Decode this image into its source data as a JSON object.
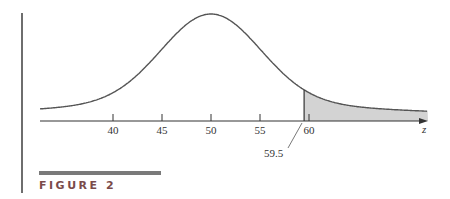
{
  "figure": {
    "label": "FIGURE 2"
  },
  "chart_data": {
    "type": "area",
    "title": "",
    "xlabel": "z",
    "ylabel": "",
    "x_ticks": [
      40,
      45,
      50,
      55,
      60
    ],
    "x_tick_labels": [
      "40",
      "45",
      "50",
      "55",
      "60"
    ],
    "annotation": {
      "label": "59.5",
      "x": 59.5
    },
    "distribution": {
      "mean": 50,
      "sd": 5
    },
    "shaded_region": {
      "from": 59.5,
      "to": "inf",
      "color": "#d3d3d3"
    },
    "grid": false
  },
  "colors": {
    "curve": "#555555",
    "shade": "#d3d3d3",
    "axis": "#333333"
  }
}
